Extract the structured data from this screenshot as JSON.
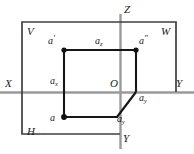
{
  "figure": {
    "type": "descriptive-geometry-diagram",
    "background_color": "#ffffff",
    "line_color": "#2b2b2b",
    "axis_color": "#8c8c8c",
    "frame_color": "#3a3a3a",
    "projector_color": "#1f1f1f",
    "canvas": {
      "width": 194,
      "height": 154
    }
  },
  "planes": [
    {
      "key": "V",
      "label": "V",
      "name": "frontal-plane",
      "x": 27,
      "y": 31
    },
    {
      "key": "W",
      "label": "W",
      "name": "profile-plane",
      "x": 161,
      "y": 31
    },
    {
      "key": "H",
      "label": "H",
      "name": "horizontal-plane",
      "x": 27,
      "y": 131
    }
  ],
  "axes": [
    {
      "key": "Z",
      "label": "Z",
      "name": "z-axis",
      "x": 120,
      "y": 9
    },
    {
      "key": "X",
      "label": "X",
      "name": "x-axis",
      "x": 5,
      "y": 83
    },
    {
      "key": "Y",
      "label": "Y",
      "name": "y-axis-right",
      "x": 175,
      "y": 83
    },
    {
      "key": "Yh",
      "label": "Y",
      "name": "y-axis-bottom",
      "x": 122,
      "y": 138
    }
  ],
  "origin": {
    "label": "O",
    "name": "origin-point",
    "x": 118,
    "y": 82,
    "coord_x": 114,
    "coord_y": 92
  },
  "points": [
    {
      "id": "a_front",
      "label": "a",
      "superscript": "'",
      "name": "point-a-prime",
      "cx": 64,
      "cy": 50,
      "label_x": 48,
      "label_y": 41,
      "marker": true
    },
    {
      "id": "a_profile",
      "label": "a",
      "superscript": "″",
      "name": "point-a-double-prime",
      "cx": 136,
      "cy": 50,
      "label_x": 139,
      "label_y": 41,
      "marker": true
    },
    {
      "id": "a_horiz",
      "label": "a",
      "superscript": "",
      "name": "point-a",
      "cx": 64,
      "cy": 117,
      "label_x": 50,
      "label_y": 119,
      "marker": true
    },
    {
      "id": "a_z",
      "label": "a",
      "subscript": "z",
      "name": "point-a-z",
      "cx": 100,
      "cy": 50,
      "label_x": 95,
      "label_y": 41,
      "marker": false
    },
    {
      "id": "a_x",
      "label": "a",
      "subscript": "x",
      "name": "point-a-x",
      "cx": 64,
      "cy": 92,
      "label_x": 50,
      "label_y": 80,
      "marker": false
    },
    {
      "id": "a_y",
      "label": "a",
      "subscript": "y",
      "name": "point-a-y",
      "cx": 136,
      "cy": 92,
      "label_x": 139,
      "label_y": 96,
      "marker": false
    },
    {
      "id": "a_yh",
      "label": "a",
      "subscript": "y",
      "name": "point-a-y-horizontal",
      "cx": 118,
      "cy": 117,
      "label_x": 117,
      "label_y": 119,
      "marker": false
    }
  ],
  "geometry": {
    "frame_outer": {
      "x": 22,
      "y": 22,
      "width": 154,
      "height": 60
    },
    "frame_lower": {
      "x": 22,
      "y": 92,
      "width": 98,
      "height": 42
    },
    "axis_horizontal": {
      "x1": 0,
      "y1": 92,
      "x2": 194,
      "y2": 92
    },
    "axis_vertical_z": {
      "x1": 120,
      "y1": 14,
      "x2": 120,
      "y2": 92
    },
    "axis_vertical_yh": {
      "x1": 120,
      "y1": 92,
      "x2": 120,
      "y2": 148
    },
    "projectors": [
      {
        "name": "a-prime-to-a-double-prime",
        "x1": 64,
        "y1": 50,
        "x2": 136,
        "y2": 50
      },
      {
        "name": "a-prime-to-a",
        "x1": 64,
        "y1": 50,
        "x2": 64,
        "y2": 117
      },
      {
        "name": "a-double-prime-to-a-y",
        "x1": 136,
        "y1": 50,
        "x2": 136,
        "y2": 92
      },
      {
        "name": "a-to-a-y-horizontal",
        "x1": 64,
        "y1": 117,
        "x2": 118,
        "y2": 117
      },
      {
        "name": "a-y-to-a-y-horizontal-diagonal",
        "x1": 136,
        "y1": 92,
        "x2": 118,
        "y2": 117
      }
    ]
  }
}
